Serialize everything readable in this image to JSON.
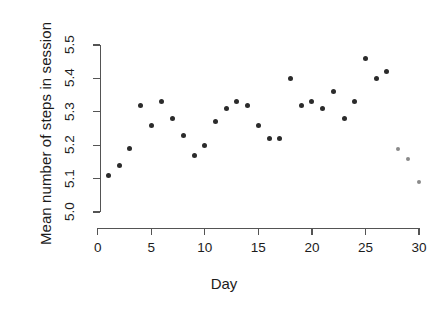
{
  "chart_data": {
    "type": "scatter",
    "title": "",
    "xlabel": "Day",
    "ylabel": "Mean number of steps in session",
    "xlim": [
      0,
      30
    ],
    "ylim": [
      5.0,
      5.5
    ],
    "grid": false,
    "legend": false,
    "x_ticks": [
      "0",
      "5",
      "10",
      "15",
      "20",
      "25",
      "30"
    ],
    "x_tick_values": [
      0,
      5,
      10,
      15,
      20,
      25,
      30
    ],
    "y_ticks": [
      "5.0",
      "5.1",
      "5.2",
      "5.3",
      "5.4",
      "5.5"
    ],
    "y_tick_values": [
      5.0,
      5.1,
      5.2,
      5.3,
      5.4,
      5.5
    ],
    "series": [
      {
        "name": "observed",
        "color": "#2b2b2b",
        "marker": "filled-circle",
        "marker_size": 5,
        "x": [
          1,
          2,
          3,
          4,
          5,
          6,
          7,
          8,
          9,
          10,
          11,
          12,
          13,
          14,
          15,
          16,
          17,
          18,
          19,
          20,
          21,
          22,
          23,
          24,
          25,
          26,
          27
        ],
        "y": [
          5.11,
          5.14,
          5.19,
          5.32,
          5.26,
          5.33,
          5.28,
          5.23,
          5.17,
          5.2,
          5.27,
          5.31,
          5.33,
          5.32,
          5.26,
          5.22,
          5.22,
          5.4,
          5.32,
          5.33,
          5.31,
          5.36,
          5.28,
          5.33,
          5.46,
          5.4,
          5.42
        ]
      },
      {
        "name": "tail",
        "color": "#8a8a8a",
        "marker": "filled-circle",
        "marker_size": 4,
        "x": [
          28,
          29,
          30
        ],
        "y": [
          5.19,
          5.16,
          5.09
        ]
      }
    ]
  },
  "axes": {
    "x_title": "Day",
    "y_title": "Mean number of steps in session"
  },
  "colors": {
    "point_dark": "#2b2b2b",
    "point_gray": "#8a8a8a",
    "axis": "#545454",
    "text": "#1c1c1c",
    "background": "#ffffff"
  }
}
